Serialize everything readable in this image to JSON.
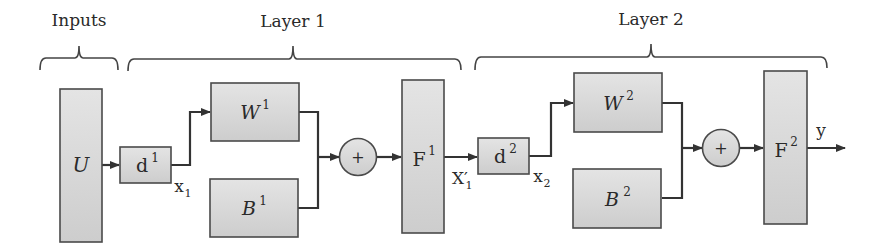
{
  "diagram": {
    "groups": [
      {
        "id": "inputs",
        "label": "Inputs"
      },
      {
        "id": "layer1",
        "label": "Layer 1"
      },
      {
        "id": "layer2",
        "label": "Layer 2"
      }
    ],
    "nodes": {
      "U": {
        "label": "U",
        "sup": ""
      },
      "d1": {
        "label": "d",
        "sup": "1"
      },
      "W1": {
        "label": "W",
        "sup": "1"
      },
      "B1": {
        "label": "B",
        "sup": "1"
      },
      "sum1": {
        "label": "+"
      },
      "F1": {
        "label": "F",
        "sup": "1"
      },
      "d2": {
        "label": "d",
        "sup": "2"
      },
      "W2": {
        "label": "W",
        "sup": "2"
      },
      "B2": {
        "label": "B",
        "sup": "2"
      },
      "sum2": {
        "label": "+"
      },
      "F2": {
        "label": "F",
        "sup": "2"
      }
    },
    "edge_labels": {
      "x1": {
        "label": "x",
        "sub": "1"
      },
      "X1p": {
        "label": "X′",
        "sub": "1"
      },
      "x2": {
        "label": "x",
        "sub": "2"
      },
      "y": {
        "label": "y"
      }
    },
    "colors": {
      "box_fill_top": "#e2e2e2",
      "box_fill_bottom": "#cfcfcf",
      "stroke": "#4a4a4a",
      "wire": "#333333"
    }
  }
}
